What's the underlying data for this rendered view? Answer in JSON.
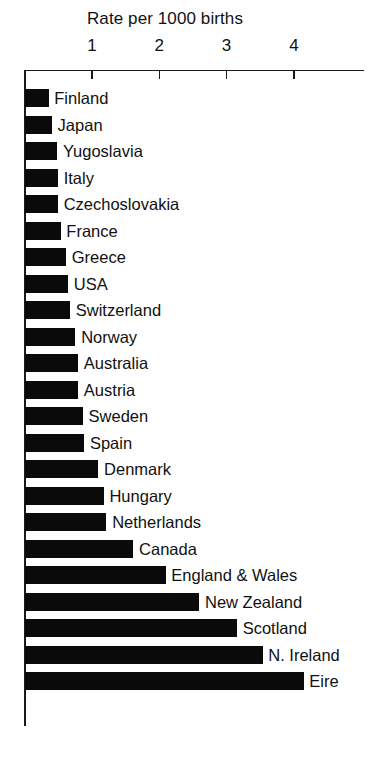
{
  "chart_data": {
    "type": "bar",
    "orientation": "horizontal",
    "title": "Rate per 1000 births",
    "xlabel": "",
    "ylabel": "",
    "xlim": [
      0,
      4.9
    ],
    "xticks": [
      1,
      2,
      3,
      4
    ],
    "xtick_labels": [
      "1",
      "2",
      "3",
      "4"
    ],
    "grid": false,
    "legend": null,
    "bar_color": "#0a0a0a",
    "axis_color": "#1a1a1a",
    "categories": [
      "Finland",
      "Japan",
      "Yugoslavia",
      "Italy",
      "Czechoslovakia",
      "France",
      "Greece",
      "USA",
      "Switzerland",
      "Norway",
      "Australia",
      "Austria",
      "Sweden",
      "Spain",
      "Denmark",
      "Hungary",
      "Netherlands",
      "Canada",
      "England & Wales",
      "New Zealand",
      "Scotland",
      "N. Ireland",
      "Eire"
    ],
    "values": [
      0.35,
      0.4,
      0.48,
      0.49,
      0.49,
      0.53,
      0.61,
      0.64,
      0.67,
      0.75,
      0.79,
      0.79,
      0.86,
      0.88,
      1.09,
      1.17,
      1.21,
      1.61,
      2.09,
      2.59,
      3.15,
      3.53,
      4.14
    ]
  }
}
